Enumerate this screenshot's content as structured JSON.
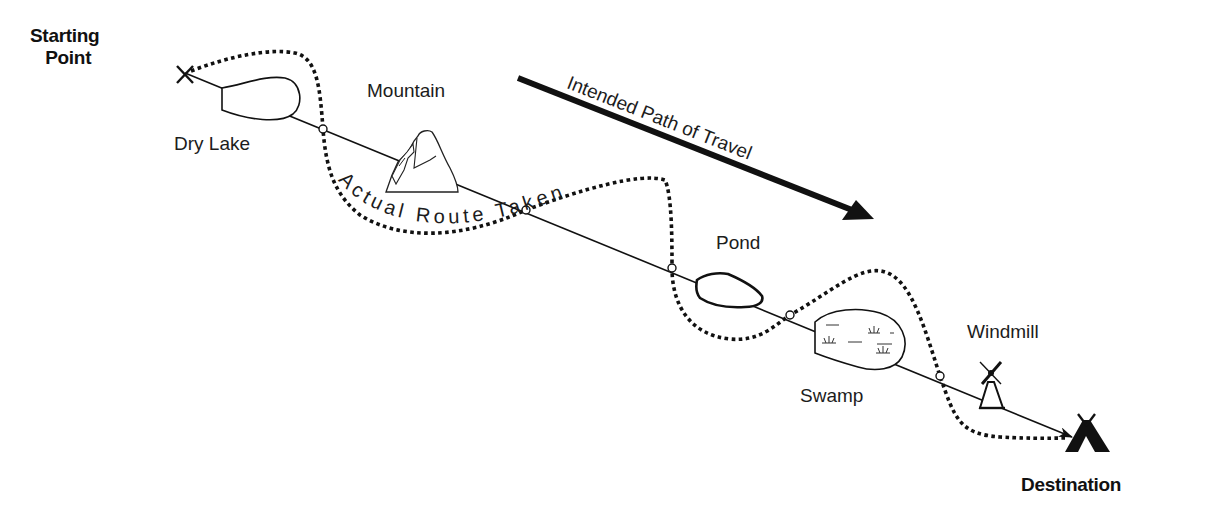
{
  "diagram": {
    "start_label_line1": "Starting",
    "start_label_line2": "Point",
    "destination_label": "Destination",
    "intended_path_label": "Intended Path of Travel",
    "actual_route_label": "Actual Route Taken",
    "landmarks": [
      {
        "name": "Dry Lake"
      },
      {
        "name": "Mountain"
      },
      {
        "name": "Pond"
      },
      {
        "name": "Swamp"
      },
      {
        "name": "Windmill"
      }
    ],
    "icons": {
      "start": "x-mark-icon",
      "destination": "teepee-icon",
      "direction": "arrow-right-down-icon",
      "crossing": "circle-marker-icon"
    },
    "colors": {
      "ink": "#111111",
      "background": "#ffffff"
    }
  }
}
